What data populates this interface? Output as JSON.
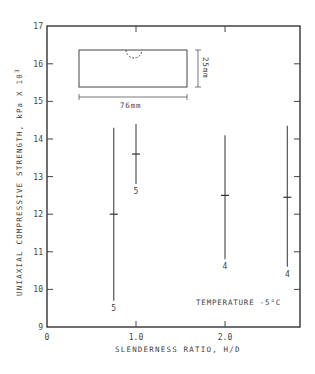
{
  "chart_data": {
    "type": "errorbar",
    "title": "",
    "xlabel": "SLENDERNESS RATIO, H/D",
    "ylabel": "UNIAXIAL COMPRESSIVE STRENGTH, kPa X 10",
    "ylabel_superscript": "3",
    "xlim": [
      0,
      2.9
    ],
    "ylim": [
      9,
      17
    ],
    "x_ticks": [
      {
        "value": 0,
        "label": "0"
      },
      {
        "value": 1.0,
        "label": "1.0"
      },
      {
        "value": 2.0,
        "label": "2.0"
      }
    ],
    "y_ticks": [
      {
        "value": 9,
        "label": "9"
      },
      {
        "value": 10,
        "label": "10"
      },
      {
        "value": 11,
        "label": "11"
      },
      {
        "value": 12,
        "label": "12"
      },
      {
        "value": 13,
        "label": "13"
      },
      {
        "value": 14,
        "label": "14"
      },
      {
        "value": 15,
        "label": "15"
      },
      {
        "value": 16,
        "label": "16"
      },
      {
        "value": 17,
        "label": "17"
      }
    ],
    "grid": false,
    "series": [
      {
        "name": "H/D ~0.75",
        "x": 0.75,
        "mean": 12.0,
        "max": 14.3,
        "min": 9.7,
        "n": "5"
      },
      {
        "name": "H/D 1.0",
        "x": 1.0,
        "mean": 13.6,
        "max": 14.4,
        "min": 12.8,
        "n": "5"
      },
      {
        "name": "H/D 2.0",
        "x": 2.0,
        "mean": 12.5,
        "max": 14.1,
        "min": 10.8,
        "n": "4"
      },
      {
        "name": "H/D ~2.7",
        "x": 2.7,
        "mean": 12.45,
        "max": 14.35,
        "min": 10.6,
        "n": "4"
      }
    ],
    "annotations": {
      "temperature": "TEMPERATURE -5°C",
      "specimen_length": "76mm",
      "specimen_height": "25mm"
    }
  }
}
